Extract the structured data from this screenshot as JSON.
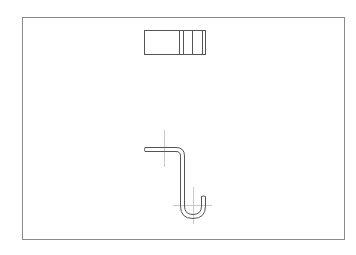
{
  "drawing": {
    "type": "technical-drawing",
    "description": "Two orthographic views of a bent wire hook",
    "colors": {
      "background": "#ffffff",
      "frame": "#8a8a8a",
      "outline": "#555555",
      "centerline": "#c8c8c8"
    },
    "frame": {
      "x": 22,
      "y": 17,
      "width": 322,
      "height": 222
    },
    "views": [
      {
        "name": "top-view",
        "rect": {
          "x": 144,
          "y": 30,
          "width": 61,
          "height": 24
        },
        "inner_lines_x": [
          179,
          183,
          192,
          202
        ]
      },
      {
        "name": "front-view",
        "shape": "j-hook",
        "centerlines": [
          {
            "orientation": "vertical",
            "x": 164,
            "y1": 130,
            "y2": 167
          },
          {
            "orientation": "vertical",
            "x": 193,
            "y1": 187,
            "y2": 224
          },
          {
            "orientation": "horizontal",
            "y": 205,
            "x1": 173,
            "x2": 212
          }
        ]
      }
    ]
  }
}
